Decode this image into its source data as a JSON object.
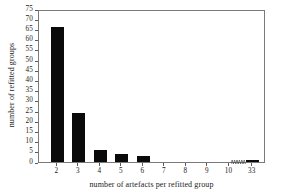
{
  "chart_data": {
    "type": "bar",
    "title": "",
    "xlabel": "number of artefacts per refitted group",
    "ylabel": "number of refitted groups",
    "categories": [
      "2",
      "3",
      "4",
      "5",
      "6",
      "7",
      "8",
      "9",
      "10",
      "33"
    ],
    "values": [
      66,
      24,
      6,
      4,
      3,
      0,
      0,
      0,
      0,
      1
    ],
    "ylim": [
      0,
      75
    ],
    "y_ticks": [
      0,
      5,
      10,
      15,
      20,
      25,
      30,
      35,
      40,
      45,
      50,
      55,
      60,
      65,
      70,
      75
    ],
    "x_ticks": [
      "2",
      "3",
      "4",
      "5",
      "6",
      "7",
      "8",
      "9",
      "10",
      "33"
    ],
    "grid": false,
    "legend": null,
    "axis_break": {
      "between": [
        "10",
        "33"
      ],
      "style": "zigzag"
    },
    "bar_color": "#0a0a0a",
    "frame_color": "#7a7a7a",
    "background": "#ffffff"
  }
}
